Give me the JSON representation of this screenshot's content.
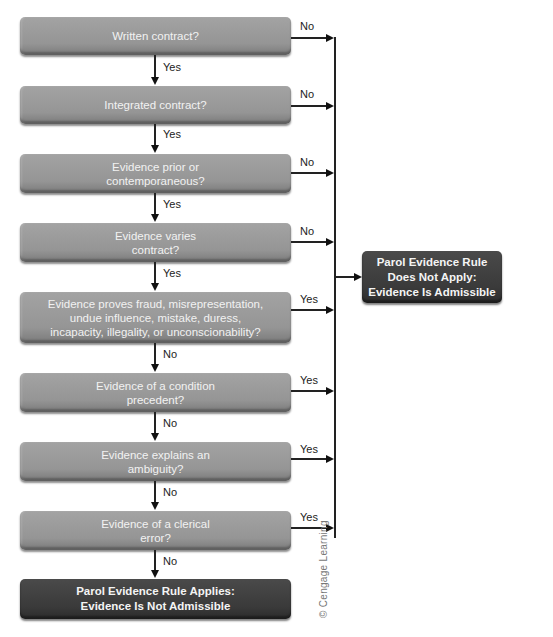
{
  "diagram": {
    "nodes": [
      {
        "id": "q1",
        "lines": [
          "Written contract?"
        ],
        "down_label": "Yes",
        "right_label": "No"
      },
      {
        "id": "q2",
        "lines": [
          "Integrated contract?"
        ],
        "down_label": "Yes",
        "right_label": "No"
      },
      {
        "id": "q3",
        "lines": [
          "Evidence prior or",
          "contemporaneous?"
        ],
        "down_label": "Yes",
        "right_label": "No"
      },
      {
        "id": "q4",
        "lines": [
          "Evidence varies",
          "contract?"
        ],
        "down_label": "Yes",
        "right_label": "No"
      },
      {
        "id": "q5",
        "lines": [
          "Evidence proves fraud, misrepresentation,",
          "undue influence, mistake, duress,",
          "incapacity, illegality, or unconscionability?"
        ],
        "down_label": "No",
        "right_label": "Yes"
      },
      {
        "id": "q6",
        "lines": [
          "Evidence of a condition",
          "precedent?"
        ],
        "down_label": "No",
        "right_label": "Yes"
      },
      {
        "id": "q7",
        "lines": [
          "Evidence explains an",
          "ambiguity?"
        ],
        "down_label": "No",
        "right_label": "Yes"
      },
      {
        "id": "q8",
        "lines": [
          "Evidence of a clerical",
          "error?"
        ],
        "down_label": "No",
        "right_label": "Yes"
      }
    ],
    "outcome_applies": {
      "lines": [
        "Parol Evidence Rule Applies:",
        "Evidence Is Not Admissible"
      ]
    },
    "outcome_not_applies": {
      "lines": [
        "Parol Evidence Rule",
        "Does Not Apply:",
        "Evidence Is Admissible"
      ]
    },
    "credit": "© Cengage Learning",
    "colors": {
      "question_box": "#999999",
      "outcome_box": "#3c3c3c",
      "line": "#222222"
    }
  }
}
